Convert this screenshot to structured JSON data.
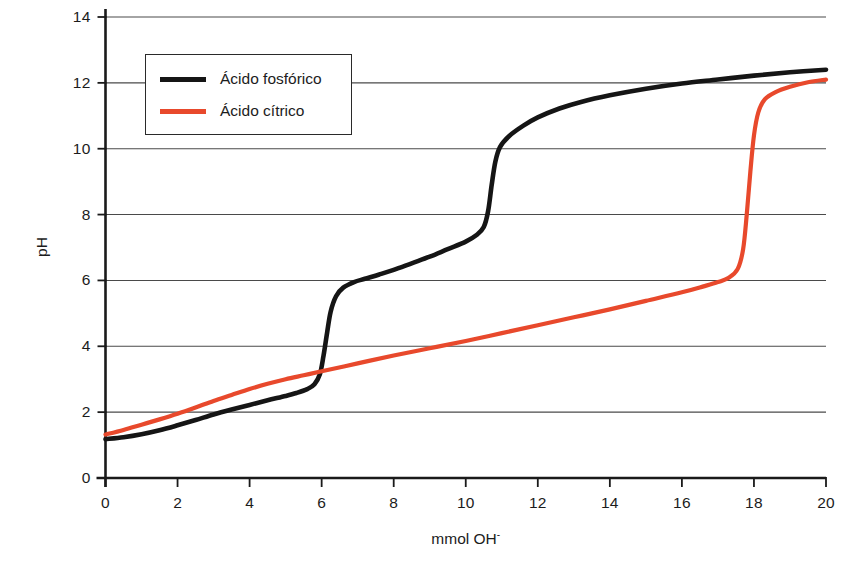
{
  "chart_data": {
    "type": "line",
    "title": "",
    "xlabel": "mmol OH-",
    "xlabel_base": "mmol OH",
    "xlabel_sup": "-",
    "ylabel": "pH",
    "xlim": [
      0,
      20
    ],
    "ylim": [
      0,
      14
    ],
    "xticks": [
      0,
      2,
      4,
      6,
      8,
      10,
      12,
      14,
      16,
      18,
      20
    ],
    "yticks": [
      0,
      2,
      4,
      6,
      8,
      10,
      12,
      14
    ],
    "grid": "horizontal",
    "legend_position": "upper-left",
    "colors": {
      "phosphoric": "#151515",
      "citric": "#E8492C",
      "grid": "#4a4a4a",
      "axis": "#1a1a1a",
      "background": "#ffffff"
    },
    "series": [
      {
        "name": "Ácido fosfórico",
        "color": "#151515",
        "points": [
          [
            0.0,
            1.18
          ],
          [
            0.5,
            1.24
          ],
          [
            1.0,
            1.33
          ],
          [
            1.5,
            1.45
          ],
          [
            2.0,
            1.6
          ],
          [
            2.5,
            1.76
          ],
          [
            3.0,
            1.93
          ],
          [
            3.5,
            2.08
          ],
          [
            4.0,
            2.22
          ],
          [
            4.5,
            2.36
          ],
          [
            5.0,
            2.49
          ],
          [
            5.3,
            2.58
          ],
          [
            5.6,
            2.7
          ],
          [
            5.8,
            2.85
          ],
          [
            5.95,
            3.15
          ],
          [
            6.05,
            3.7
          ],
          [
            6.15,
            4.4
          ],
          [
            6.25,
            5.05
          ],
          [
            6.4,
            5.52
          ],
          [
            6.6,
            5.78
          ],
          [
            6.9,
            5.95
          ],
          [
            7.2,
            6.05
          ],
          [
            7.6,
            6.18
          ],
          [
            8.0,
            6.32
          ],
          [
            8.5,
            6.52
          ],
          [
            9.0,
            6.72
          ],
          [
            9.5,
            6.95
          ],
          [
            10.0,
            7.18
          ],
          [
            10.3,
            7.38
          ],
          [
            10.5,
            7.62
          ],
          [
            10.62,
            8.1
          ],
          [
            10.72,
            8.9
          ],
          [
            10.82,
            9.6
          ],
          [
            10.95,
            10.05
          ],
          [
            11.2,
            10.38
          ],
          [
            11.6,
            10.7
          ],
          [
            12.0,
            10.95
          ],
          [
            12.6,
            11.22
          ],
          [
            13.2,
            11.42
          ],
          [
            14.0,
            11.62
          ],
          [
            15.0,
            11.82
          ],
          [
            16.0,
            11.98
          ],
          [
            17.0,
            12.1
          ],
          [
            18.0,
            12.22
          ],
          [
            19.0,
            12.32
          ],
          [
            20.0,
            12.4
          ]
        ]
      },
      {
        "name": "Ácido cítrico",
        "color": "#E8492C",
        "points": [
          [
            0.0,
            1.32
          ],
          [
            0.5,
            1.46
          ],
          [
            1.0,
            1.62
          ],
          [
            1.5,
            1.78
          ],
          [
            2.0,
            1.95
          ],
          [
            2.5,
            2.14
          ],
          [
            3.0,
            2.34
          ],
          [
            3.5,
            2.52
          ],
          [
            4.0,
            2.7
          ],
          [
            4.5,
            2.86
          ],
          [
            5.0,
            3.0
          ],
          [
            5.5,
            3.12
          ],
          [
            6.0,
            3.24
          ],
          [
            7.0,
            3.48
          ],
          [
            8.0,
            3.72
          ],
          [
            9.0,
            3.94
          ],
          [
            10.0,
            4.16
          ],
          [
            11.0,
            4.4
          ],
          [
            12.0,
            4.64
          ],
          [
            13.0,
            4.88
          ],
          [
            14.0,
            5.12
          ],
          [
            15.0,
            5.38
          ],
          [
            16.0,
            5.64
          ],
          [
            16.6,
            5.82
          ],
          [
            17.0,
            5.95
          ],
          [
            17.3,
            6.08
          ],
          [
            17.55,
            6.35
          ],
          [
            17.7,
            6.95
          ],
          [
            17.8,
            8.0
          ],
          [
            17.9,
            9.3
          ],
          [
            18.0,
            10.4
          ],
          [
            18.12,
            11.1
          ],
          [
            18.3,
            11.5
          ],
          [
            18.6,
            11.72
          ],
          [
            19.0,
            11.88
          ],
          [
            19.5,
            12.02
          ],
          [
            20.0,
            12.1
          ]
        ]
      }
    ]
  },
  "legend": {
    "items": [
      {
        "label": "Ácido fosfórico",
        "swatch": "black"
      },
      {
        "label": "Ácido cítrico",
        "swatch": "red"
      }
    ]
  }
}
